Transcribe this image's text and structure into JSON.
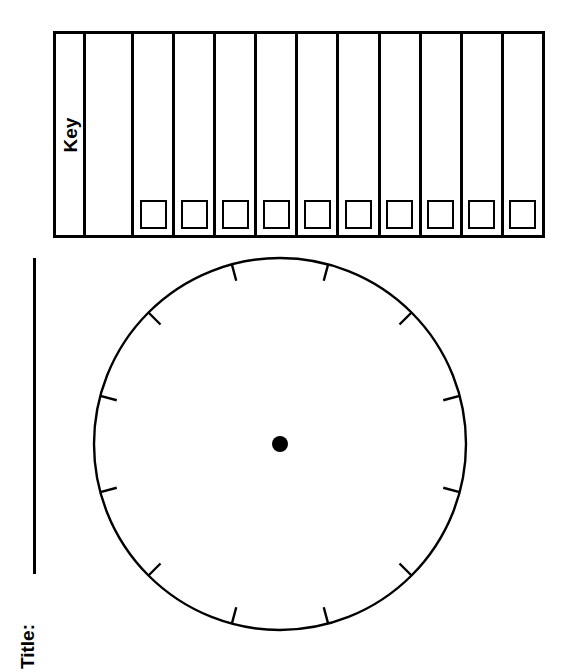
{
  "worksheet": {
    "name": "blank-pie-chart-worksheet",
    "background_color": "#ffffff",
    "ink_color": "#000000"
  },
  "key": {
    "label": "Key",
    "label_rotation_deg": -90,
    "total_columns": 12,
    "label_column_index": 0,
    "blank_column_index": 1,
    "swatch_columns": 10,
    "columns": [
      {
        "type": "label",
        "text": "Key",
        "has_swatch": false
      },
      {
        "type": "blank",
        "text": "",
        "has_swatch": false
      },
      {
        "type": "entry",
        "text": "",
        "has_swatch": true
      },
      {
        "type": "entry",
        "text": "",
        "has_swatch": true
      },
      {
        "type": "entry",
        "text": "",
        "has_swatch": true
      },
      {
        "type": "entry",
        "text": "",
        "has_swatch": true
      },
      {
        "type": "entry",
        "text": "",
        "has_swatch": true
      },
      {
        "type": "entry",
        "text": "",
        "has_swatch": true
      },
      {
        "type": "entry",
        "text": "",
        "has_swatch": true
      },
      {
        "type": "entry",
        "text": "",
        "has_swatch": true
      },
      {
        "type": "entry",
        "text": "",
        "has_swatch": true
      },
      {
        "type": "entry",
        "text": "",
        "has_swatch": true
      }
    ]
  },
  "title": {
    "label": "Title:",
    "value": "",
    "rotation_deg": -90,
    "rule_visible": true
  },
  "chart_data": {
    "type": "pie",
    "title": "",
    "labels": [],
    "values": [],
    "slices": [],
    "legend_position": "top",
    "is_blank_template": true,
    "center": {
      "x": 280,
      "y": 444
    },
    "radius": 186,
    "center_dot_radius": 8,
    "tick_count": 12,
    "tick_interval_deg": 30,
    "tick_offset_deg": 15,
    "tick_length": 17,
    "tick_angles_deg": [
      15,
      45,
      75,
      105,
      135,
      165,
      195,
      225,
      255,
      285,
      315,
      345
    ],
    "stroke_width": 2.4,
    "fill": "#ffffff",
    "stroke": "#000000"
  }
}
